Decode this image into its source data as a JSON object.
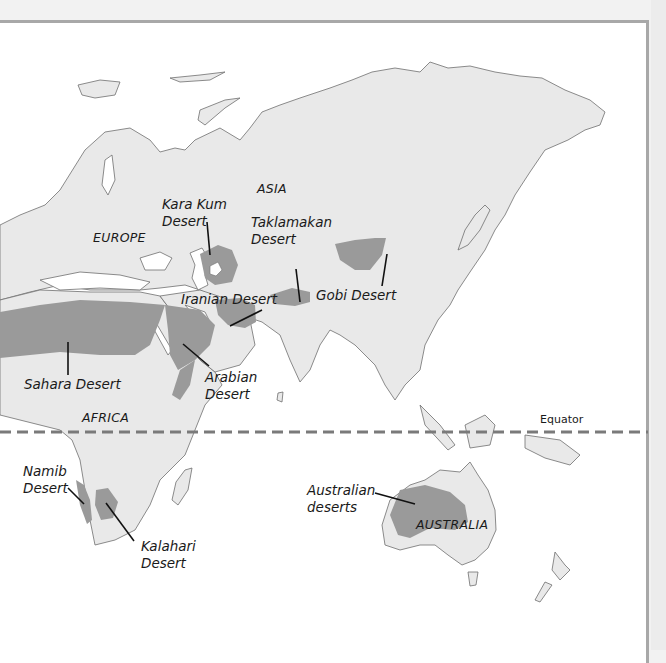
{
  "map": {
    "colors": {
      "land": "#e9e9e9",
      "coast": "#6e6e6e",
      "desert": "#9a9a9a",
      "equator": "#7a7a7a",
      "frame": "#a8a8a8"
    },
    "regions": {
      "europe": "EUROPE",
      "asia": "ASIA",
      "africa": "AFRICA",
      "australia": "AUSTRALIA"
    },
    "equator_label": "Equator",
    "deserts": [
      {
        "id": "kara-kum",
        "line1": "Kara Kum",
        "line2": "Desert"
      },
      {
        "id": "taklamakan",
        "line1": "Taklamakan",
        "line2": "Desert"
      },
      {
        "id": "gobi",
        "line1": "Gobi Desert",
        "line2": ""
      },
      {
        "id": "iranian",
        "line1": "Iranian Desert",
        "line2": ""
      },
      {
        "id": "sahara",
        "line1": "Sahara Desert",
        "line2": ""
      },
      {
        "id": "arabian",
        "line1": "Arabian",
        "line2": "Desert"
      },
      {
        "id": "namib",
        "line1": "Namib",
        "line2": "Desert"
      },
      {
        "id": "kalahari",
        "line1": "Kalahari",
        "line2": "Desert"
      },
      {
        "id": "australian",
        "line1": "Australian",
        "line2": "deserts"
      }
    ]
  }
}
